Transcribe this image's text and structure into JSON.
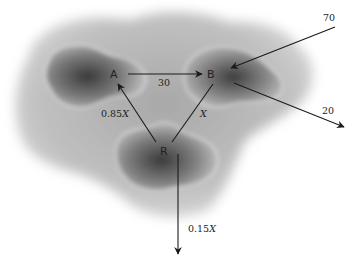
{
  "diagram": {
    "type": "flow-network",
    "nodes": [
      {
        "id": "A",
        "label": "A",
        "x": 116,
        "y": 74
      },
      {
        "id": "B",
        "label": "B",
        "x": 212,
        "y": 74
      },
      {
        "id": "R",
        "label": "R",
        "x": 165,
        "y": 151
      }
    ],
    "edges": [
      {
        "from": "A",
        "to": "B",
        "label": "30"
      },
      {
        "from": "external",
        "to": "B",
        "label": "70"
      },
      {
        "from": "B",
        "to": "external",
        "label": "20"
      },
      {
        "from": "R",
        "to": "A",
        "label_num": "0.85",
        "label_var": "X"
      },
      {
        "from": "B",
        "to": "R",
        "label_num": "",
        "label_var": "X"
      },
      {
        "from": "R",
        "to": "external",
        "label_num": "0.15",
        "label_var": "X"
      }
    ]
  },
  "labels": {
    "node_a": "A",
    "node_b": "B",
    "node_r": "R",
    "flow_ab": "30",
    "flow_in_b": "70",
    "flow_out_b": "20",
    "flow_ra_num": "0.85",
    "flow_ra_var": "X",
    "flow_br_var": "X",
    "flow_r_out_num": "0.15",
    "flow_r_out_var": "X"
  },
  "colors": {
    "background": "#ffffff",
    "region_outer": "#c8c8c8",
    "region_inner": "#6a6a6a",
    "arrow": "#1a1a1a"
  }
}
